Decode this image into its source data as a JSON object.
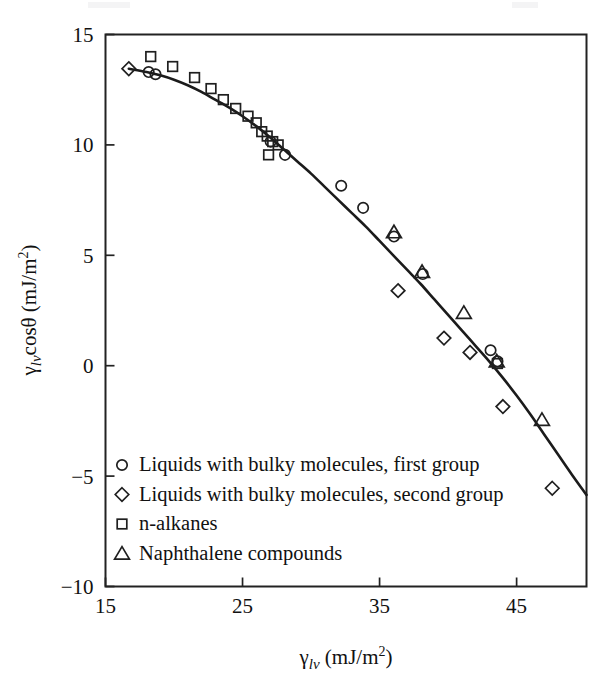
{
  "chart_data": {
    "type": "scatter",
    "title": "",
    "xlabel": "γlv (mJ/m²)",
    "ylabel": "γlv cosθ (mJ/m²)",
    "xlim": [
      15,
      50.1
    ],
    "ylim": [
      -10,
      15
    ],
    "xticks": [
      15,
      25,
      35,
      45
    ],
    "xtick_labels": [
      "15",
      "25",
      "35",
      "45"
    ],
    "yticks": [
      15,
      10,
      5,
      0,
      -5,
      -10
    ],
    "ytick_labels": [
      "15",
      "10",
      "5",
      "0",
      "−5",
      "−10"
    ],
    "grid": false,
    "legend_position": "lower-left-inside",
    "axis_label_parts": {
      "x_gamma": "γ",
      "x_sub": "lv",
      "x_units": " (mJ/m",
      "x_sup": "2",
      "x_close": ")",
      "y_gamma": "γ",
      "y_sub": "lv",
      "y_cos": "cosθ",
      "y_units": " (mJ/m",
      "y_sup": "2",
      "y_close": ")"
    },
    "series": [
      {
        "name": "Liquids with bulky molecules, first group",
        "marker": "circle",
        "points": [
          [
            18.15,
            13.3
          ],
          [
            18.65,
            13.2
          ],
          [
            27.05,
            10.15
          ],
          [
            28.1,
            9.55
          ],
          [
            32.2,
            8.15
          ],
          [
            33.8,
            7.15
          ],
          [
            36.05,
            5.85
          ],
          [
            38.15,
            4.15
          ],
          [
            43.1,
            0.7
          ],
          [
            43.6,
            0.2
          ]
        ]
      },
      {
        "name": "Liquids with bulky molecules, second group",
        "marker": "diamond",
        "points": [
          [
            16.7,
            13.45
          ],
          [
            36.35,
            3.4
          ],
          [
            39.7,
            1.25
          ],
          [
            41.6,
            0.6
          ],
          [
            44.0,
            -1.85
          ],
          [
            47.6,
            -5.55
          ]
        ]
      },
      {
        "name": "n-alkanes",
        "marker": "square",
        "points": [
          [
            18.3,
            14.0
          ],
          [
            19.9,
            13.55
          ],
          [
            21.5,
            13.05
          ],
          [
            22.7,
            12.55
          ],
          [
            23.6,
            12.05
          ],
          [
            24.5,
            11.65
          ],
          [
            25.4,
            11.3
          ],
          [
            26.0,
            11.0
          ],
          [
            26.4,
            10.6
          ],
          [
            26.8,
            10.4
          ],
          [
            27.2,
            10.15
          ],
          [
            27.6,
            10.0
          ],
          [
            26.9,
            9.55
          ],
          [
            43.6,
            0.1
          ]
        ]
      },
      {
        "name": "Naphthalene compounds",
        "marker": "triangle",
        "points": [
          [
            36.05,
            6.05
          ],
          [
            38.1,
            4.25
          ],
          [
            41.15,
            2.4
          ],
          [
            43.55,
            0.2
          ],
          [
            46.85,
            -2.45
          ]
        ]
      }
    ],
    "fit_curve": {
      "description": "smooth monotonically decreasing fitted curve through the data",
      "points": [
        [
          16.7,
          13.45
        ],
        [
          18.0,
          13.3
        ],
        [
          19.0,
          13.15
        ],
        [
          20.0,
          12.95
        ],
        [
          21.0,
          12.7
        ],
        [
          22.0,
          12.4
        ],
        [
          23.0,
          12.05
        ],
        [
          24.0,
          11.7
        ],
        [
          25.0,
          11.3
        ],
        [
          26.0,
          10.85
        ],
        [
          27.0,
          10.35
        ],
        [
          28.0,
          9.8
        ],
        [
          29.0,
          9.25
        ],
        [
          30.0,
          8.7
        ],
        [
          31.0,
          8.1
        ],
        [
          32.0,
          7.5
        ],
        [
          33.0,
          6.9
        ],
        [
          34.0,
          6.3
        ],
        [
          35.0,
          5.65
        ],
        [
          36.0,
          5.0
        ],
        [
          37.0,
          4.35
        ],
        [
          38.0,
          3.7
        ],
        [
          39.0,
          3.0
        ],
        [
          40.0,
          2.3
        ],
        [
          41.0,
          1.6
        ],
        [
          42.0,
          0.9
        ],
        [
          43.0,
          0.2
        ],
        [
          44.0,
          -0.55
        ],
        [
          45.0,
          -1.35
        ],
        [
          46.0,
          -2.2
        ],
        [
          47.0,
          -3.1
        ],
        [
          48.0,
          -4.0
        ],
        [
          49.0,
          -4.9
        ],
        [
          50.1,
          -5.85
        ]
      ]
    }
  },
  "legend": {
    "items": [
      {
        "marker": "circle",
        "label": "Liquids with bulky molecules, first group"
      },
      {
        "marker": "diamond",
        "label": "Liquids with bulky molecules, second group"
      },
      {
        "marker": "square",
        "label": "n-alkanes"
      },
      {
        "marker": "triangle",
        "label": "Naphthalene compounds"
      }
    ]
  },
  "colors": {
    "axis": "#222222",
    "curve": "#1b1b1b",
    "marker": "#1f1f1f",
    "background": "#ffffff",
    "text": "#111111"
  }
}
